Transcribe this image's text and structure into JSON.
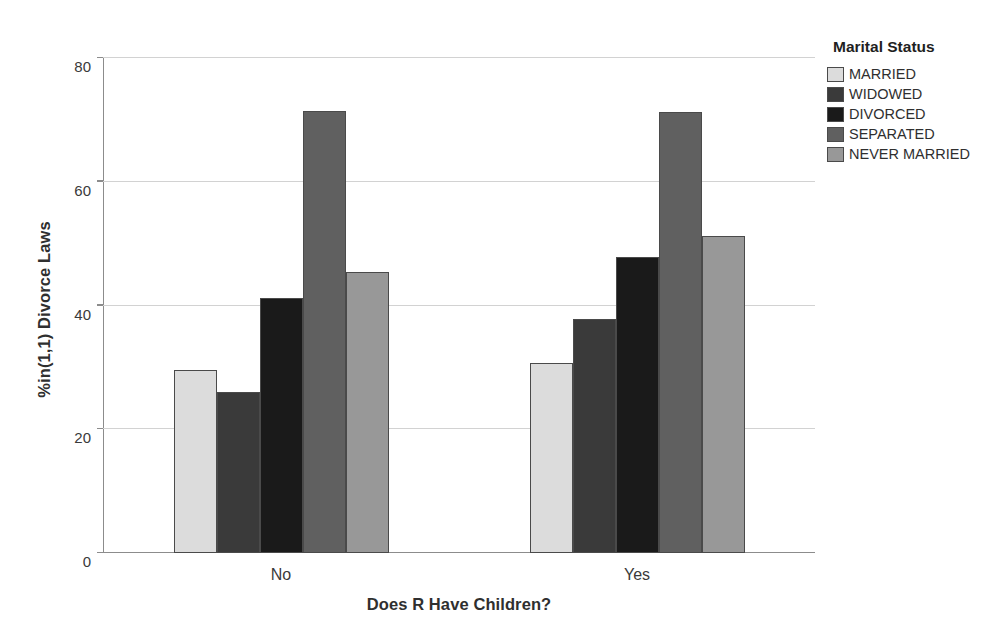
{
  "chart_data": {
    "type": "bar",
    "title": "",
    "xlabel": "Does R Have Children?",
    "ylabel": "%in(1,1) Divorce Laws",
    "categories": [
      "No",
      "Yes"
    ],
    "series": [
      {
        "name": "MARRIED",
        "color": "#dcdcdc",
        "values": [
          29.5,
          30.7
        ]
      },
      {
        "name": "WIDOWED",
        "color": "#3a3a3a",
        "values": [
          26.0,
          37.8
        ]
      },
      {
        "name": "DIVORCED",
        "color": "#1a1a1a",
        "values": [
          41.2,
          47.9
        ]
      },
      {
        "name": "SEPARATED",
        "color": "#606060",
        "values": [
          71.4,
          71.2
        ]
      },
      {
        "name": "NEVER MARRIED",
        "color": "#989898",
        "values": [
          45.4,
          51.2
        ]
      }
    ],
    "ylim": [
      0,
      80
    ],
    "yticks": [
      0,
      20,
      40,
      60,
      80
    ],
    "ytick_labels": [
      "0",
      "20",
      "40",
      "60",
      "80"
    ],
    "grid": true,
    "legend": {
      "title": "Marital Status",
      "position": "right"
    },
    "axis_color": "#8c8c8c",
    "grid_color": "#d2d2d2",
    "bar_edge_color": "#4a4a4a",
    "background": "#ffffff"
  }
}
